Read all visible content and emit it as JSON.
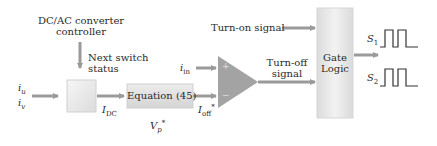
{
  "diagram": {
    "title_block": {
      "line1": "DC/AC converter",
      "line2": "controller"
    },
    "next_switch": {
      "line1": "Next switch",
      "line2": "status"
    },
    "inputs": {
      "iu": "i",
      "iu_sub": "u",
      "iv": "i",
      "iv_sub": "v"
    },
    "idc": {
      "main": "I",
      "sub": "DC"
    },
    "equation_box": {
      "label": "Equation (45)"
    },
    "ioff": {
      "main": "I",
      "sub": "off",
      "sup": "*"
    },
    "vp": {
      "main": "V",
      "sub": "p",
      "sup": "*"
    },
    "iin": {
      "main": "i",
      "sub": "in"
    },
    "comparator": {
      "plus": "+",
      "minus": "−"
    },
    "turn_off": {
      "line1": "Turn-off",
      "line2": "signal"
    },
    "turn_on": {
      "label": "Turn-on signal"
    },
    "gate_logic": {
      "line1": "Gate",
      "line2": "Logic"
    },
    "outputs": {
      "s1": "S",
      "s1_sub": "1",
      "s2": "S",
      "s2_sub": "2"
    },
    "colors": {
      "arrow": "#9a9a9a",
      "box_fill": "#e8e8e8",
      "triangle": "#a3a3a3",
      "line": "#333333"
    }
  }
}
